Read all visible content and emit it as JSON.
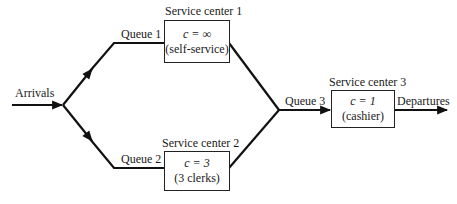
{
  "diagram": {
    "type": "queueing-network",
    "arrivals_label": "Arrivals",
    "departures_label": "Departures",
    "queues": [
      {
        "label": "Queue 1"
      },
      {
        "label": "Queue 2"
      },
      {
        "label": "Queue 3"
      }
    ],
    "service_centers": [
      {
        "title": "Service center 1",
        "capacity_var": "c",
        "capacity": "c = ∞",
        "description": "(self-service)"
      },
      {
        "title": "Service center 2",
        "capacity_var": "c",
        "capacity": "c = 3",
        "description": "(3 clerks)"
      },
      {
        "title": "Service center 3",
        "capacity_var": "c",
        "capacity": "c = 1",
        "description": "(cashier)"
      }
    ],
    "colors": {
      "line": "#111111",
      "text": "#1a1a1a",
      "background": "#ffffff"
    }
  }
}
